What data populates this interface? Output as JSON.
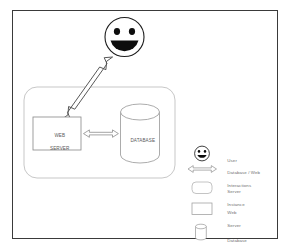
{
  "diagram": {
    "frame": {
      "border_color": "#3a3a3a",
      "background": "#ffffff"
    },
    "actor": {
      "icon": "smiley-face-icon",
      "label": "User",
      "stroke": "#1a1a1a"
    },
    "server_instance": {
      "name": "server-instance-container",
      "shape": "rounded-rectangle",
      "stroke": "#b8b8b8"
    },
    "nodes": [
      {
        "id": "web-server",
        "shape": "rectangle",
        "label_line1": "WEB",
        "label_line2": "SERVER",
        "stroke": "#8a8a8a"
      },
      {
        "id": "database",
        "shape": "cylinder",
        "label_line1": "DATABASE",
        "label_line2": "",
        "stroke": "#9a9a9a"
      }
    ],
    "connectors": [
      {
        "id": "user-to-server-arrow",
        "type": "double-headed-arrow",
        "orientation": "diagonal",
        "stroke": "#4a4a4a"
      },
      {
        "id": "server-to-database-arrow",
        "type": "double-headed-arrow",
        "orientation": "horizontal",
        "stroke": "#8a8a8a"
      }
    ]
  },
  "legend": {
    "items": [
      {
        "icon": "smiley-face-icon",
        "label_line1": "User",
        "label_line2": ""
      },
      {
        "icon": "double-arrow-icon",
        "label_line1": "Database / Web",
        "label_line2": "Interactions"
      },
      {
        "icon": "rounded-rectangle-icon",
        "label_line1": "Server",
        "label_line2": "Instance"
      },
      {
        "icon": "rectangle-icon",
        "label_line1": "Web",
        "label_line2": "Server"
      },
      {
        "icon": "cylinder-icon",
        "label_line1": "Database",
        "label_line2": ""
      }
    ]
  }
}
